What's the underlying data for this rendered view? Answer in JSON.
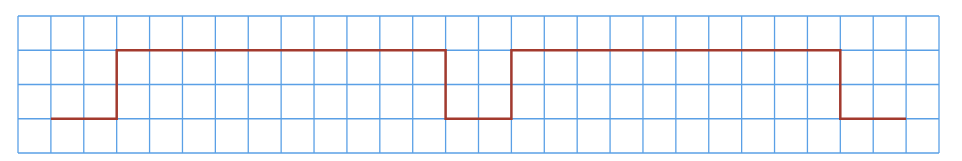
{
  "diagram": {
    "type": "square-wave-on-grid",
    "grid": {
      "columns": 28,
      "rows": 4,
      "left": 18,
      "top": 16,
      "right": 939,
      "bottom": 153,
      "color": "#5aa0e6"
    },
    "waveform": {
      "color": "#a33a2e",
      "levels": {
        "low_row": 3,
        "high_row": 1
      },
      "points_in_cells": [
        [
          1,
          3
        ],
        [
          3,
          3
        ],
        [
          3,
          1
        ],
        [
          13,
          1
        ],
        [
          13,
          3
        ],
        [
          15,
          3
        ],
        [
          15,
          1
        ],
        [
          25,
          1
        ],
        [
          25,
          3
        ],
        [
          27,
          3
        ]
      ]
    }
  }
}
